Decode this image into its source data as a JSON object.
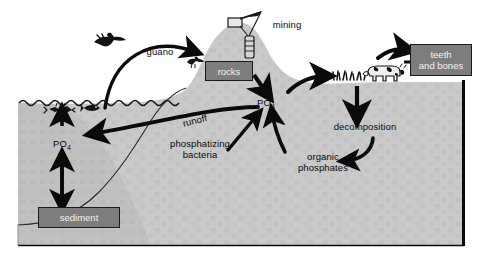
{
  "diagram": {
    "background_color": "#ffffff",
    "land_color": "#c9c9c9",
    "ocean_color": "#c0c0c0",
    "box_fill_color": "#7d7d7d",
    "box_text_color": "#f2f2f2",
    "line_color": "#0a0a0a"
  },
  "labels": {
    "guano": "guano",
    "mining": "mining",
    "runoff": "runoff",
    "phosphatizing_bacteria_line1": "phosphatizing",
    "phosphatizing_bacteria_line2": "bacteria",
    "decomposition": "decomposition",
    "organic_line1": "organic",
    "organic_line2": "phosphates",
    "po4_ocean": "PO",
    "po4_ocean_sub": "4",
    "po4_land": "PO",
    "po4_land_sub": "4"
  },
  "boxes": {
    "rocks": "rocks",
    "sediment": "sediment",
    "teeth_and_bones_line1": "teeth",
    "teeth_and_bones_line2": "and bones"
  },
  "icons": {
    "flying_bird": "bird-icon",
    "perched_bird": "bird-icon",
    "fish": "fish-icon",
    "plankton": "plankton-icon",
    "cow": "cow-icon",
    "grass": "grass-icon",
    "derrick": "mining-derrick-icon",
    "waves": "water-surface-icon"
  }
}
